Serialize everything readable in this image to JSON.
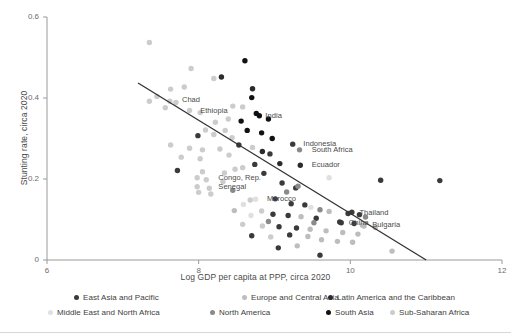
{
  "chart_data": {
    "type": "scatter",
    "title": "",
    "xlabel": "Log GDP per capita at PPP, circa 2020",
    "ylabel": "Stunting rate, circa 2020",
    "xlim": [
      6,
      12
    ],
    "ylim": [
      0,
      0.6
    ],
    "xticks": [
      "6",
      "8",
      "10",
      "12"
    ],
    "xtick_values": [
      6,
      8,
      10,
      12
    ],
    "yticks": [
      "0",
      "0.2",
      "0.4",
      "0.6"
    ],
    "ytick_values": [
      0,
      0.2,
      0.4,
      0.6
    ],
    "grid": false,
    "legend_position": "bottom",
    "trendline": {
      "x0": 7.2,
      "y0": 0.437,
      "x1": 11.0,
      "y1": 0.0,
      "color": "#333333"
    },
    "series": [
      {
        "name": "East Asia and Pacific",
        "color": "#3a3a3a"
      },
      {
        "name": "Europe and Central Asia",
        "color": "#bdbdbd"
      },
      {
        "name": "Latin America and the Caribbean",
        "color": "#2b2b2b"
      },
      {
        "name": "Middle East and North Africa",
        "color": "#e0e0e0"
      },
      {
        "name": "North America",
        "color": "#8a8a8a"
      },
      {
        "name": "South Asia",
        "color": "#111111"
      },
      {
        "name": "Sub-Saharan Africa",
        "color": "#cccccc"
      }
    ],
    "annotations": [
      {
        "text": "Chad",
        "x": 7.74,
        "y": 0.394
      },
      {
        "text": "Ethiopia",
        "x": 7.98,
        "y": 0.369
      },
      {
        "text": "India",
        "x": 8.84,
        "y": 0.356
      },
      {
        "text": "Indonesia",
        "x": 9.34,
        "y": 0.286
      },
      {
        "text": "South Africa",
        "x": 9.45,
        "y": 0.272
      },
      {
        "text": "Ecuador",
        "x": 9.45,
        "y": 0.234
      },
      {
        "text": "Congo, Rep.",
        "x": 8.22,
        "y": 0.203
      },
      {
        "text": "Senegal",
        "x": 8.22,
        "y": 0.181
      },
      {
        "text": "Morocco",
        "x": 8.86,
        "y": 0.15
      },
      {
        "text": "Thailand",
        "x": 10.08,
        "y": 0.115
      },
      {
        "text": "China",
        "x": 9.94,
        "y": 0.092
      },
      {
        "text": "Bulgaria",
        "x": 10.25,
        "y": 0.086
      }
    ],
    "points": [
      {
        "x": 7.35,
        "y": 0.537,
        "g": 6
      },
      {
        "x": 7.9,
        "y": 0.473,
        "g": 6
      },
      {
        "x": 8.3,
        "y": 0.452,
        "g": 2
      },
      {
        "x": 8.2,
        "y": 0.448,
        "g": 6
      },
      {
        "x": 8.61,
        "y": 0.492,
        "g": 5
      },
      {
        "x": 8.71,
        "y": 0.423,
        "g": 2
      },
      {
        "x": 7.81,
        "y": 0.427,
        "g": 6
      },
      {
        "x": 7.63,
        "y": 0.422,
        "g": 6
      },
      {
        "x": 7.45,
        "y": 0.404,
        "g": 6
      },
      {
        "x": 7.35,
        "y": 0.392,
        "g": 6
      },
      {
        "x": 7.7,
        "y": 0.389,
        "g": 6
      },
      {
        "x": 7.56,
        "y": 0.376,
        "g": 6
      },
      {
        "x": 8.7,
        "y": 0.401,
        "g": 5
      },
      {
        "x": 8.45,
        "y": 0.38,
        "g": 6
      },
      {
        "x": 8.58,
        "y": 0.378,
        "g": 6
      },
      {
        "x": 8.02,
        "y": 0.364,
        "g": 6
      },
      {
        "x": 8.76,
        "y": 0.362,
        "g": 5
      },
      {
        "x": 8.39,
        "y": 0.348,
        "g": 6
      },
      {
        "x": 8.56,
        "y": 0.343,
        "g": 5
      },
      {
        "x": 8.22,
        "y": 0.34,
        "g": 6
      },
      {
        "x": 8.92,
        "y": 0.348,
        "g": 5
      },
      {
        "x": 8.09,
        "y": 0.321,
        "g": 6
      },
      {
        "x": 8.35,
        "y": 0.32,
        "g": 6
      },
      {
        "x": 8.64,
        "y": 0.32,
        "g": 5
      },
      {
        "x": 8.83,
        "y": 0.314,
        "g": 5
      },
      {
        "x": 7.99,
        "y": 0.307,
        "g": 0
      },
      {
        "x": 8.2,
        "y": 0.31,
        "g": 6
      },
      {
        "x": 8.44,
        "y": 0.302,
        "g": 6
      },
      {
        "x": 8.97,
        "y": 0.3,
        "g": 5
      },
      {
        "x": 7.63,
        "y": 0.284,
        "g": 6
      },
      {
        "x": 7.88,
        "y": 0.276,
        "g": 6
      },
      {
        "x": 8.05,
        "y": 0.272,
        "g": 6
      },
      {
        "x": 8.28,
        "y": 0.274,
        "g": 6
      },
      {
        "x": 8.53,
        "y": 0.284,
        "g": 0
      },
      {
        "x": 8.71,
        "y": 0.278,
        "g": 6
      },
      {
        "x": 8.4,
        "y": 0.259,
        "g": 6
      },
      {
        "x": 7.77,
        "y": 0.254,
        "g": 6
      },
      {
        "x": 8.02,
        "y": 0.25,
        "g": 6
      },
      {
        "x": 8.84,
        "y": 0.268,
        "g": 2
      },
      {
        "x": 8.94,
        "y": 0.262,
        "g": 0
      },
      {
        "x": 7.72,
        "y": 0.221,
        "g": 0
      },
      {
        "x": 8.05,
        "y": 0.218,
        "g": 6
      },
      {
        "x": 8.34,
        "y": 0.215,
        "g": 6
      },
      {
        "x": 8.48,
        "y": 0.224,
        "g": 6
      },
      {
        "x": 8.58,
        "y": 0.228,
        "g": 6
      },
      {
        "x": 8.74,
        "y": 0.236,
        "g": 0
      },
      {
        "x": 9.07,
        "y": 0.238,
        "g": 2
      },
      {
        "x": 8.86,
        "y": 0.214,
        "g": 0
      },
      {
        "x": 8.1,
        "y": 0.198,
        "g": 6
      },
      {
        "x": 8.32,
        "y": 0.193,
        "g": 6
      },
      {
        "x": 8.14,
        "y": 0.177,
        "g": 6
      },
      {
        "x": 8.45,
        "y": 0.172,
        "g": 4
      },
      {
        "x": 8.16,
        "y": 0.163,
        "g": 6
      },
      {
        "x": 9.1,
        "y": 0.19,
        "g": 0
      },
      {
        "x": 9.28,
        "y": 0.178,
        "g": 0
      },
      {
        "x": 9.31,
        "y": 0.182,
        "g": 4
      },
      {
        "x": 8.68,
        "y": 0.148,
        "g": 6
      },
      {
        "x": 8.59,
        "y": 0.137,
        "g": 3
      },
      {
        "x": 9.01,
        "y": 0.151,
        "g": 0
      },
      {
        "x": 9.22,
        "y": 0.139,
        "g": 0
      },
      {
        "x": 9.4,
        "y": 0.136,
        "g": 0
      },
      {
        "x": 9.48,
        "y": 0.13,
        "g": 3
      },
      {
        "x": 9.6,
        "y": 0.124,
        "g": 4
      },
      {
        "x": 9.72,
        "y": 0.12,
        "g": 1
      },
      {
        "x": 8.83,
        "y": 0.121,
        "g": 6
      },
      {
        "x": 8.47,
        "y": 0.122,
        "g": 1
      },
      {
        "x": 8.69,
        "y": 0.11,
        "g": 3
      },
      {
        "x": 8.98,
        "y": 0.113,
        "g": 0
      },
      {
        "x": 9.18,
        "y": 0.11,
        "g": 0
      },
      {
        "x": 9.35,
        "y": 0.107,
        "g": 1
      },
      {
        "x": 9.55,
        "y": 0.103,
        "g": 0
      },
      {
        "x": 10.02,
        "y": 0.118,
        "g": 0
      },
      {
        "x": 10.12,
        "y": 0.112,
        "g": 0
      },
      {
        "x": 10.2,
        "y": 0.106,
        "g": 4
      },
      {
        "x": 9.86,
        "y": 0.094,
        "g": 0
      },
      {
        "x": 10.05,
        "y": 0.09,
        "g": 0
      },
      {
        "x": 10.18,
        "y": 0.084,
        "g": 1
      },
      {
        "x": 10.33,
        "y": 0.08,
        "g": 1
      },
      {
        "x": 8.58,
        "y": 0.088,
        "g": 6
      },
      {
        "x": 8.84,
        "y": 0.084,
        "g": 6
      },
      {
        "x": 9.06,
        "y": 0.082,
        "g": 0
      },
      {
        "x": 9.29,
        "y": 0.079,
        "g": 0
      },
      {
        "x": 9.47,
        "y": 0.076,
        "g": 1
      },
      {
        "x": 9.68,
        "y": 0.072,
        "g": 1
      },
      {
        "x": 9.9,
        "y": 0.068,
        "g": 1
      },
      {
        "x": 10.1,
        "y": 0.064,
        "g": 1
      },
      {
        "x": 8.7,
        "y": 0.06,
        "g": 0
      },
      {
        "x": 8.95,
        "y": 0.057,
        "g": 6
      },
      {
        "x": 9.2,
        "y": 0.062,
        "g": 0
      },
      {
        "x": 9.44,
        "y": 0.058,
        "g": 1
      },
      {
        "x": 9.62,
        "y": 0.05,
        "g": 1
      },
      {
        "x": 9.83,
        "y": 0.046,
        "g": 1
      },
      {
        "x": 10.03,
        "y": 0.044,
        "g": 1
      },
      {
        "x": 9.05,
        "y": 0.03,
        "g": 0
      },
      {
        "x": 9.3,
        "y": 0.035,
        "g": 1
      },
      {
        "x": 10.4,
        "y": 0.197,
        "g": 0
      },
      {
        "x": 11.18,
        "y": 0.196,
        "g": 0
      },
      {
        "x": 9.6,
        "y": 0.012,
        "g": 0
      },
      {
        "x": 10.55,
        "y": 0.022,
        "g": 1
      },
      {
        "x": 9.72,
        "y": 0.203,
        "g": 3
      },
      {
        "x": 8.92,
        "y": 0.095,
        "g": 4
      },
      {
        "x": 9.52,
        "y": 0.092,
        "g": 4
      },
      {
        "x": 9.16,
        "y": 0.168,
        "g": 4
      },
      {
        "x": 7.98,
        "y": 0.203,
        "g": 6
      },
      {
        "x": 7.98,
        "y": 0.181,
        "g": 6
      },
      {
        "x": 8.0,
        "y": 0.167,
        "g": 6
      },
      {
        "x": 7.62,
        "y": 0.392,
        "g": 6
      },
      {
        "x": 7.88,
        "y": 0.369,
        "g": 6
      },
      {
        "x": 8.8,
        "y": 0.356,
        "g": 5
      },
      {
        "x": 9.24,
        "y": 0.286,
        "g": 0
      },
      {
        "x": 9.33,
        "y": 0.272,
        "g": 4
      },
      {
        "x": 9.34,
        "y": 0.234,
        "g": 2
      },
      {
        "x": 8.75,
        "y": 0.15,
        "g": 3
      },
      {
        "x": 9.97,
        "y": 0.115,
        "g": 0
      },
      {
        "x": 9.88,
        "y": 0.092,
        "g": 0
      },
      {
        "x": 10.16,
        "y": 0.086,
        "g": 1
      }
    ]
  },
  "legend": {
    "items": [
      {
        "label": "East Asia and Pacific"
      },
      {
        "label": "Europe and Central Asia"
      },
      {
        "label": "Latin America and the Caribbean"
      },
      {
        "label": "Middle East and North Africa"
      },
      {
        "label": "North America"
      },
      {
        "label": "South Asia"
      },
      {
        "label": "Sub-Saharan Africa"
      }
    ]
  }
}
